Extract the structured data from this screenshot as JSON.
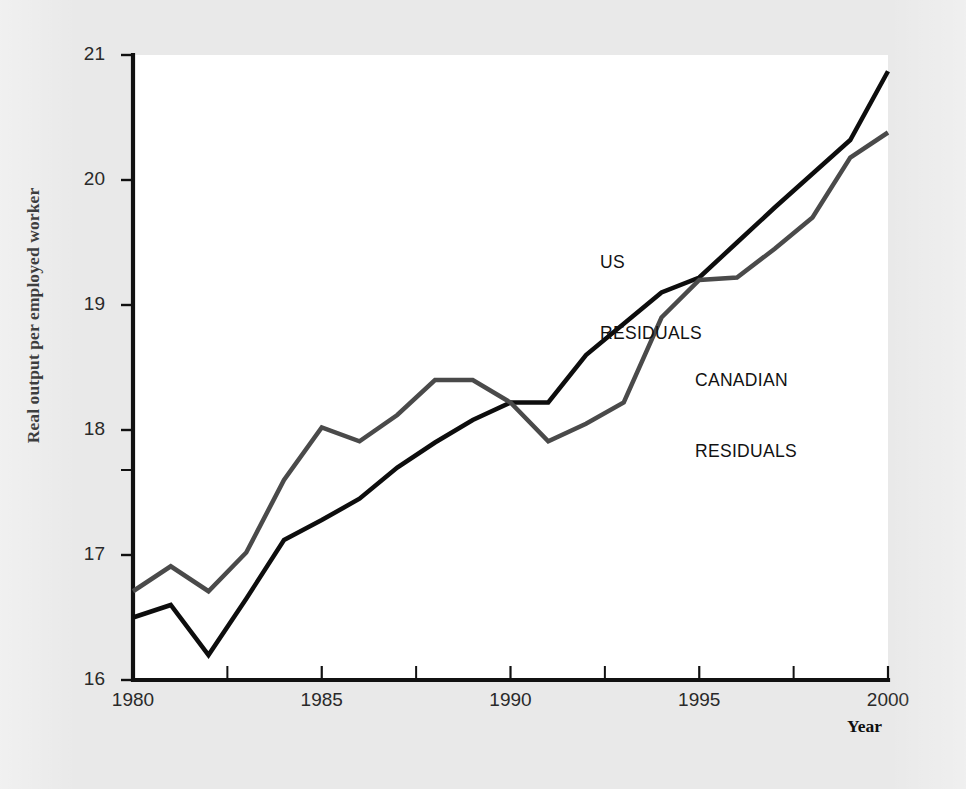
{
  "figure": {
    "background_color": "#e9e9e9",
    "plot_background_color": "#ffffff",
    "axis_color": "#111111"
  },
  "axis": {
    "y_title": "Real output per employed worker",
    "x_title": "Year",
    "y_ticks": [
      "16",
      "17",
      "18",
      "19",
      "20",
      "21"
    ],
    "x_ticks": [
      "1980",
      "1985",
      "1990",
      "1995",
      "2000"
    ]
  },
  "annotations": {
    "us_label_line1": "US",
    "us_label_line2": "RESIDUALS",
    "canadian_label_line1": "CANADIAN",
    "canadian_label_line2": "RESIDUALS"
  },
  "chart_data": {
    "type": "line",
    "title": "",
    "subtitle": "",
    "xlabel": "Year",
    "ylabel": "Real output per employed worker",
    "xlim": [
      1980,
      2000
    ],
    "ylim": [
      16,
      21
    ],
    "x_tick_values": [
      1980,
      1985,
      1990,
      1995,
      2000
    ],
    "y_tick_values": [
      16,
      17,
      18,
      19,
      20,
      21
    ],
    "x_minor_tick_values": [
      1982.5,
      1987.5,
      1992.5,
      1997.5
    ],
    "y_minor_tick_values": [
      17.68
    ],
    "grid": false,
    "legend": "inline-annotations",
    "x": [
      1980,
      1981,
      1982,
      1983,
      1984,
      1985,
      1986,
      1987,
      1988,
      1989,
      1990,
      1991,
      1992,
      1993,
      1994,
      1995,
      1996,
      1997,
      1998,
      1999,
      2000
    ],
    "series": [
      {
        "name": "US RESIDUALS",
        "color": "#0d0d0d",
        "line_width": 4.5,
        "values": [
          16.5,
          16.6,
          16.2,
          16.65,
          17.12,
          17.28,
          17.45,
          17.7,
          17.9,
          18.08,
          18.22,
          18.22,
          18.6,
          18.85,
          19.1,
          19.22,
          19.5,
          19.78,
          20.05,
          20.32,
          20.87
        ]
      },
      {
        "name": "CANADIAN RESIDUALS",
        "color": "#4a4a4a",
        "line_width": 4.5,
        "values": [
          16.71,
          16.91,
          16.71,
          17.02,
          17.6,
          18.02,
          17.91,
          18.12,
          18.4,
          18.4,
          18.22,
          17.91,
          18.05,
          18.22,
          18.9,
          19.2,
          19.22,
          19.45,
          19.7,
          20.18,
          20.38
        ]
      }
    ]
  }
}
